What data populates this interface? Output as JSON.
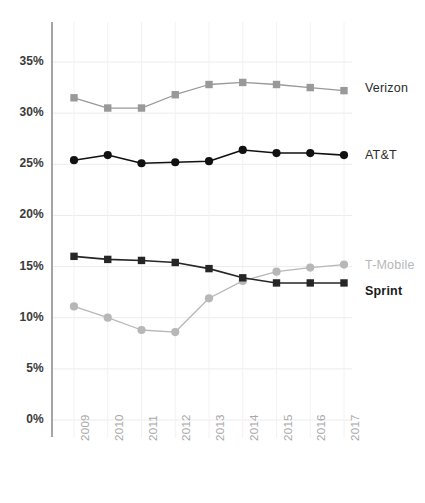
{
  "chart_data": {
    "type": "line",
    "title": "",
    "xlabel": "",
    "ylabel": "",
    "categories": [
      "2009",
      "2010",
      "2011",
      "2012",
      "2013",
      "2014",
      "2015",
      "2016",
      "2017"
    ],
    "ylim": [
      0,
      35
    ],
    "ytick_labels": [
      "0%",
      "5%",
      "10%",
      "15%",
      "20%",
      "25%",
      "30%",
      "35%"
    ],
    "ytick_values": [
      0,
      5,
      10,
      15,
      20,
      25,
      30,
      35
    ],
    "grid": true,
    "legend_position": "right-inline",
    "series": [
      {
        "name": "Verizon",
        "color": "#999999",
        "marker": "square",
        "label_color": "#2b2b2b",
        "values": [
          31.5,
          30.5,
          30.5,
          31.8,
          32.8,
          33.0,
          32.8,
          32.5,
          32.2
        ]
      },
      {
        "name": "AT&T",
        "color": "#111111",
        "marker": "circle",
        "label_color": "#2b2b2b",
        "values": [
          25.4,
          25.9,
          25.1,
          25.2,
          25.3,
          26.4,
          26.1,
          26.1,
          25.9
        ]
      },
      {
        "name": "T-Mobile",
        "color": "#b7b7b7",
        "marker": "circle",
        "label_color": "#b7b7b7",
        "values": [
          11.1,
          10.0,
          8.8,
          8.6,
          11.9,
          13.6,
          14.5,
          14.9,
          15.2
        ]
      },
      {
        "name": "Sprint",
        "color": "#262626",
        "marker": "square",
        "label_color": "#1a1a1a",
        "values": [
          16.0,
          15.7,
          15.6,
          15.4,
          14.8,
          13.9,
          13.4,
          13.4,
          13.4
        ]
      }
    ]
  }
}
